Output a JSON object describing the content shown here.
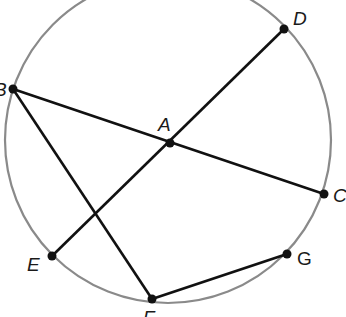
{
  "diagram": {
    "circle": {
      "cx": 168,
      "cy": 140,
      "r": 163,
      "stroke": "#8a8a8a"
    },
    "points": {
      "A": {
        "label": "A",
        "x": 170,
        "y": 143
      },
      "B": {
        "label": "B",
        "x": 13,
        "y": 89
      },
      "C": {
        "label": "C",
        "x": 324,
        "y": 194
      },
      "D": {
        "label": "D",
        "x": 284,
        "y": 29
      },
      "E": {
        "label": "E",
        "x": 52,
        "y": 256
      },
      "F": {
        "label": "F",
        "x": 152,
        "y": 299
      },
      "G": {
        "label": "G",
        "x": 287,
        "y": 254
      }
    },
    "segments": [
      "BC",
      "DE",
      "BF",
      "FG"
    ],
    "line_color": "#111111"
  }
}
